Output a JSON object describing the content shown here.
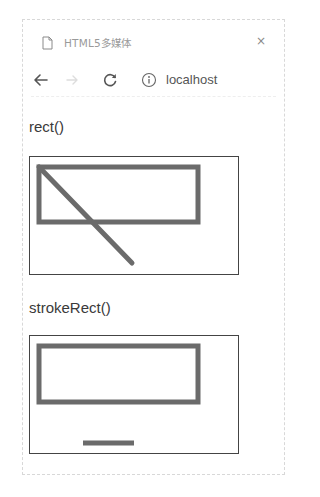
{
  "browser": {
    "tab": {
      "title": "HTML5多媒体",
      "icon": "document-icon",
      "close_label": "×"
    },
    "nav": {
      "back_icon": "arrow-left-icon",
      "forward_icon": "arrow-right-icon",
      "reload_icon": "reload-icon",
      "info_icon": "info-icon",
      "url": "localhost"
    }
  },
  "page": {
    "sections": [
      {
        "label": "rect()",
        "canvas": {
          "stroke_color": "#6b6b6b",
          "line_width": 5,
          "rect": {
            "x": 9,
            "y": 10,
            "w": 159,
            "h": 55
          },
          "line": {
            "x1": 9,
            "y1": 10,
            "x2": 102,
            "y2": 106
          }
        }
      },
      {
        "label": "strokeRect()",
        "canvas": {
          "stroke_color": "#6b6b6b",
          "line_width": 5,
          "rect": {
            "x": 9,
            "y": 10,
            "w": 159,
            "h": 56
          },
          "line": {
            "x1": 53,
            "y1": 107,
            "x2": 104,
            "y2": 107
          }
        }
      }
    ]
  },
  "colors": {
    "canvas_border": "#444444",
    "stroke": "#6b6b6b",
    "label_text": "#3a3a3a",
    "tab_text": "#9a9a9a"
  }
}
